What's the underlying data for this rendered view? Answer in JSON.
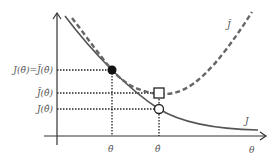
{
  "diagram": {
    "colors": {
      "axis": "#333333",
      "curve_J": "#555555",
      "curve_J_tilde": "#666666",
      "guide": "#222222",
      "label": "#555555"
    },
    "axes": {
      "x_label": "θ",
      "x_ticks": [
        {
          "label": "θ̄",
          "name": "theta-bar"
        },
        {
          "label": "θ̂",
          "name": "theta-hat"
        }
      ],
      "y_ticks": [
        {
          "label": "J(θ̄)=J̃(θ̄)",
          "name": "J-theta-bar-equals-Jtilde-theta-bar"
        },
        {
          "label": "J̃(θ̂)",
          "name": "Jtilde-theta-hat"
        },
        {
          "label": "J(θ̂)",
          "name": "J-theta-hat"
        }
      ]
    },
    "curves": [
      {
        "name": "J",
        "label": "J",
        "style": "solid"
      },
      {
        "name": "J-tilde",
        "label": "J̃",
        "style": "dashed"
      }
    ],
    "markers": [
      {
        "name": "filled-circle",
        "at": "(θ̄, J(θ̄))"
      },
      {
        "name": "open-square",
        "at": "(θ̂, J̃(θ̂))"
      },
      {
        "name": "open-circle",
        "at": "(θ̂, J(θ̂))"
      }
    ]
  }
}
